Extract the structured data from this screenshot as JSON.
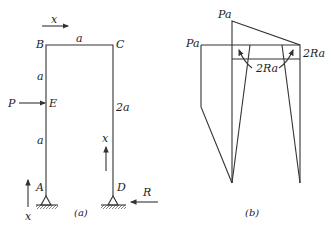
{
  "figure_a": {
    "caption": "(a)",
    "nodes": {
      "A": "A",
      "B": "B",
      "C": "C",
      "D": "D",
      "E": "E"
    },
    "dimensions": {
      "BC": "a",
      "BE": "a",
      "EA": "a",
      "CD": "2a"
    },
    "loads": {
      "P": "P",
      "R": "R"
    },
    "coordinate_labels": {
      "top": "x",
      "left_bottom": "x",
      "right_column": "x"
    }
  },
  "figure_b": {
    "caption": "(b)",
    "labels": {
      "pa_top": "Pa",
      "pa_left": "Pa",
      "two_ra_right": "2Ra",
      "two_ra_center": "2Ra"
    }
  },
  "colors": {
    "line": "#333333",
    "text": "#222222",
    "background": "#ffffff"
  }
}
